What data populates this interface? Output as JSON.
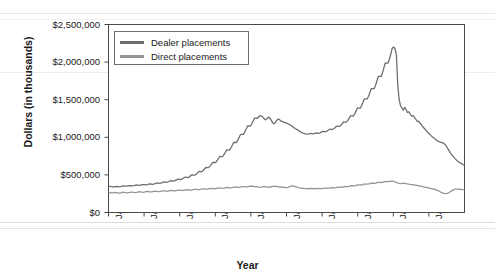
{
  "chart_data": {
    "type": "line",
    "title": "",
    "xlabel": "Year",
    "ylabel": "Dollars (in thousands)",
    "ylim": [
      0,
      2500000
    ],
    "yticks": [
      0,
      500000,
      1000000,
      1500000,
      2000000,
      2500000
    ],
    "ytick_labels": [
      "$0",
      "$500,000",
      "$1,000,000",
      "$1,500,000",
      "$2,000,000",
      "$2,500,000"
    ],
    "xtick_labels": [
      "Jan-91",
      "Jan-93",
      "Jan-95",
      "Jan-97",
      "Jan-99",
      "Jan-01",
      "Jan-03",
      "Jan-05",
      "Jan-07",
      "Jan-09"
    ],
    "xlim": [
      "Jan-91",
      "Jan-11"
    ],
    "grid": false,
    "legend_position": "upper left",
    "series": [
      {
        "name": "Dealer placements",
        "color": "#6f6f6f",
        "values": [
          350000,
          348000,
          344000,
          341000,
          339000,
          343000,
          347000,
          345000,
          342000,
          346000,
          351000,
          355000,
          352000,
          350000,
          354000,
          358000,
          356000,
          353000,
          357000,
          362000,
          366000,
          363000,
          360000,
          364000,
          369000,
          372000,
          370000,
          367000,
          371000,
          376000,
          380000,
          378000,
          375000,
          380000,
          386000,
          392000,
          390000,
          387000,
          393000,
          400000,
          407000,
          405000,
          402000,
          409000,
          417000,
          424000,
          421000,
          418000,
          426000,
          435000,
          444000,
          441000,
          438000,
          447000,
          458000,
          469000,
          466000,
          463000,
          474000,
          487000,
          500000,
          498000,
          496000,
          510000,
          527000,
          545000,
          543000,
          541000,
          558000,
          578000,
          599000,
          597000,
          596000,
          617000,
          641000,
          667000,
          665000,
          664000,
          688000,
          715000,
          745000,
          744000,
          743000,
          769000,
          800000,
          833000,
          832000,
          831000,
          860000,
          895000,
          932000,
          931000,
          930000,
          962000,
          1000000,
          1040000,
          1039000,
          1038000,
          1072000,
          1110000,
          1151000,
          1150000,
          1149000,
          1180000,
          1216000,
          1255000,
          1254000,
          1253000,
          1274000,
          1288000,
          1282000,
          1269000,
          1245000,
          1232000,
          1250000,
          1268000,
          1255000,
          1228000,
          1195000,
          1180000,
          1198000,
          1225000,
          1243000,
          1234000,
          1218000,
          1208000,
          1202000,
          1196000,
          1188000,
          1180000,
          1172000,
          1160000,
          1146000,
          1132000,
          1120000,
          1108000,
          1098000,
          1086000,
          1074000,
          1062000,
          1054000,
          1048000,
          1044000,
          1042000,
          1046000,
          1052000,
          1049000,
          1045000,
          1050000,
          1058000,
          1056000,
          1052000,
          1058000,
          1068000,
          1078000,
          1076000,
          1074000,
          1082000,
          1095000,
          1108000,
          1106000,
          1104000,
          1114000,
          1130000,
          1148000,
          1146000,
          1144000,
          1158000,
          1180000,
          1205000,
          1203000,
          1202000,
          1222000,
          1252000,
          1285000,
          1284000,
          1283000,
          1310000,
          1348000,
          1390000,
          1389000,
          1388000,
          1420000,
          1465000,
          1512000,
          1511000,
          1510000,
          1545000,
          1595000,
          1648000,
          1647000,
          1646000,
          1690000,
          1748000,
          1810000,
          1809000,
          1808000,
          1856000,
          1920000,
          1988000,
          1987000,
          1986000,
          2038000,
          2108000,
          2182000,
          2200000,
          2180000,
          2100000,
          1700000,
          1500000,
          1420000,
          1390000,
          1360000,
          1400000,
          1370000,
          1330000,
          1340000,
          1310000,
          1280000,
          1290000,
          1265000,
          1238000,
          1210000,
          1215000,
          1190000,
          1168000,
          1140000,
          1120000,
          1100000,
          1078000,
          1058000,
          1040000,
          1022000,
          1005000,
          990000,
          975000,
          960000,
          948000,
          940000,
          935000,
          930000,
          920000,
          905000,
          880000,
          850000,
          820000,
          790000,
          765000,
          742000,
          720000,
          700000,
          685000,
          672000,
          660000,
          648000,
          636000,
          630000
        ]
      },
      {
        "name": "Direct placements",
        "color": "#949494",
        "values": [
          268000,
          265000,
          262000,
          260000,
          263000,
          266000,
          264000,
          261000,
          259000,
          262000,
          266000,
          269000,
          267000,
          264000,
          262000,
          265000,
          269000,
          272000,
          270000,
          267000,
          265000,
          268000,
          272000,
          276000,
          274000,
          271000,
          269000,
          272000,
          276000,
          280000,
          278000,
          275000,
          273000,
          276000,
          280000,
          284000,
          282000,
          279000,
          278000,
          281000,
          285000,
          289000,
          287000,
          284000,
          283000,
          286000,
          290000,
          294000,
          292000,
          289000,
          288000,
          291000,
          295000,
          299000,
          297000,
          294000,
          293000,
          296000,
          300000,
          304000,
          302000,
          299000,
          298000,
          301000,
          305000,
          309000,
          307000,
          305000,
          304000,
          307000,
          311000,
          315000,
          313000,
          311000,
          310000,
          313000,
          317000,
          321000,
          319000,
          317000,
          316000,
          319000,
          323000,
          327000,
          325000,
          323000,
          322000,
          325000,
          329000,
          333000,
          331000,
          329000,
          328000,
          331000,
          335000,
          339000,
          337000,
          335000,
          334000,
          337000,
          341000,
          345000,
          343000,
          341000,
          340000,
          343000,
          347000,
          351000,
          349000,
          347000,
          345000,
          343000,
          340000,
          337000,
          335000,
          338000,
          342000,
          345000,
          343000,
          340000,
          338000,
          336000,
          339000,
          343000,
          347000,
          351000,
          348000,
          345000,
          342000,
          340000,
          338000,
          336000,
          334000,
          332000,
          330000,
          334000,
          340000,
          348000,
          355000,
          352000,
          348000,
          342000,
          336000,
          330000,
          327000,
          324000,
          322000,
          320000,
          318000,
          317000,
          316000,
          318000,
          320000,
          319000,
          317000,
          316000,
          318000,
          320000,
          319000,
          318000,
          317000,
          319000,
          322000,
          324000,
          323000,
          322000,
          324000,
          327000,
          330000,
          329000,
          328000,
          330000,
          334000,
          338000,
          337000,
          336000,
          338000,
          342000,
          346000,
          345000,
          344000,
          347000,
          352000,
          357000,
          356000,
          355000,
          358000,
          363000,
          368000,
          367000,
          366000,
          369000,
          374000,
          379000,
          378000,
          377000,
          380000,
          385000,
          390000,
          389000,
          388000,
          391000,
          396000,
          401000,
          400000,
          399000,
          402000,
          407000,
          412000,
          411000,
          410000,
          412000,
          415000,
          418000,
          416000,
          412000,
          406000,
          398000,
          392000,
          388000,
          385000,
          387000,
          390000,
          388000,
          384000,
          380000,
          377000,
          374000,
          372000,
          370000,
          368000,
          365000,
          362000,
          358000,
          354000,
          350000,
          346000,
          342000,
          338000,
          334000,
          330000,
          326000,
          322000,
          318000,
          314000,
          310000,
          306000,
          300000,
          292000,
          282000,
          272000,
          264000,
          258000,
          254000,
          252000,
          255000,
          262000,
          272000,
          284000,
          296000,
          305000,
          310000,
          312000,
          311000,
          309000,
          307000,
          305000,
          303000,
          302000
        ]
      }
    ]
  }
}
